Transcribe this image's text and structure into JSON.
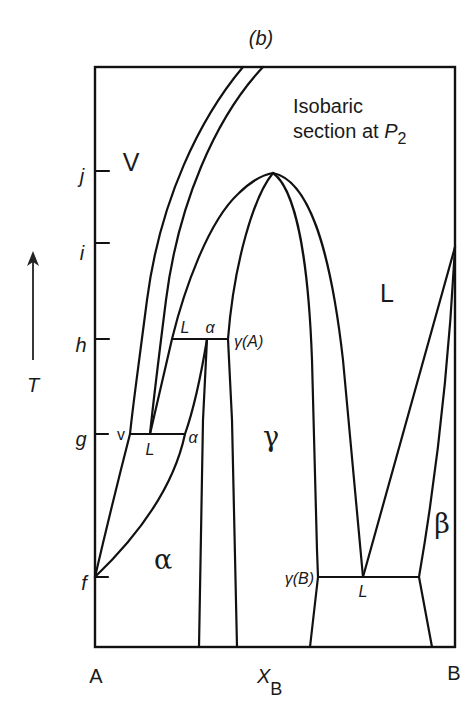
{
  "figure": {
    "panel_label": "(b)",
    "annotation": {
      "line1": "Isobaric",
      "line2_prefix": "section at ",
      "pressure_symbol": "P",
      "pressure_subscript": "2"
    },
    "colors": {
      "line": "#111111",
      "background": "#ffffff"
    }
  },
  "axes": {
    "x": {
      "left_label": "A",
      "right_label": "B",
      "title_symbol": "X",
      "title_subscript": "B"
    },
    "y": {
      "title": "T",
      "arrow": "up-arrow"
    },
    "ticks": [
      {
        "label": "j"
      },
      {
        "label": "i"
      },
      {
        "label": "h"
      },
      {
        "label": "g"
      },
      {
        "label": "f"
      }
    ]
  },
  "regions": {
    "vapor": "V",
    "liquid": "L",
    "alpha": "α",
    "gamma": "γ",
    "beta": "β"
  },
  "tie_lines": {
    "h": {
      "left": "L",
      "middle": "α",
      "right": "γ(A)"
    },
    "g": {
      "left": "v",
      "middle": "L",
      "right": "α"
    },
    "bottom": {
      "left": "γ(B)",
      "middle": "L"
    }
  }
}
